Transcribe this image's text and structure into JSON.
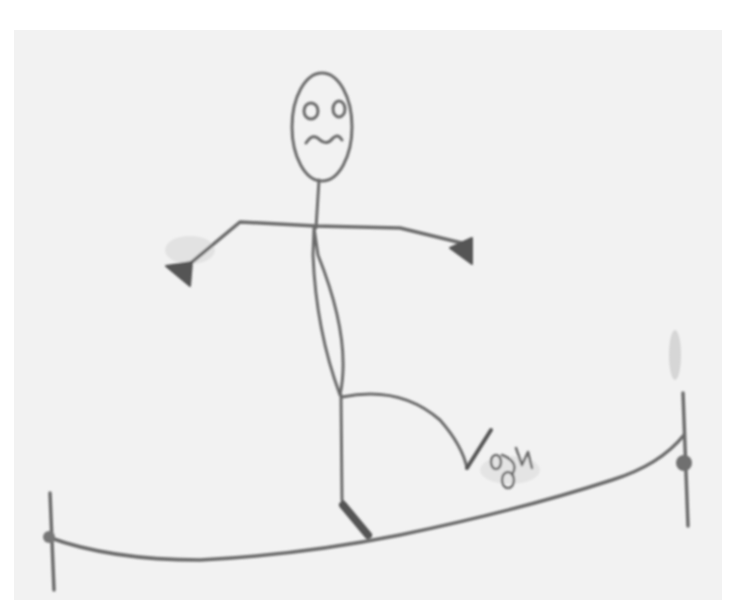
{
  "image": {
    "description": "Pencil sketch of a worried stick figure balancing on a tightrope",
    "signature": "gw",
    "colors": {
      "background": "#ffffff",
      "paper": "#f2f2f2",
      "pencil": "#6e6e6e",
      "pencil_dark": "#555555"
    }
  }
}
